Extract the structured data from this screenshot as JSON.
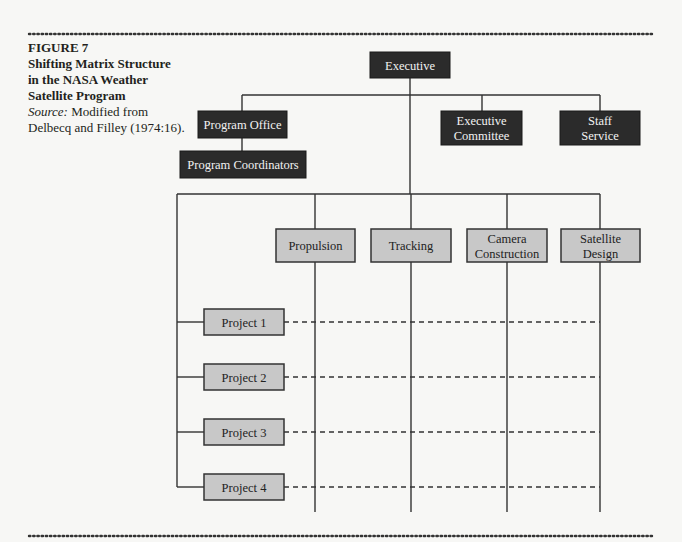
{
  "figure": {
    "label": "FIGURE 7",
    "title_lines": [
      "Shifting Matrix Structure",
      "in the NASA Weather",
      "Satellite Program"
    ],
    "source_label": "Source:",
    "source_text_lines": [
      " Modified from",
      "Delbecq and Filley (1974:16)."
    ]
  },
  "nodes": {
    "executive": [
      "Executive"
    ],
    "program_office": [
      "Program Office"
    ],
    "program_coordinators": [
      "Program Coordinators"
    ],
    "executive_committee": [
      "Executive",
      "Committee"
    ],
    "staff_service": [
      "Staff",
      "Service"
    ],
    "functions": [
      [
        "Propulsion"
      ],
      [
        "Tracking"
      ],
      [
        "Camera",
        "Construction"
      ],
      [
        "Satellite",
        "Design"
      ]
    ],
    "projects": [
      "Project 1",
      "Project 2",
      "Project 3",
      "Project 4"
    ]
  },
  "colors": {
    "management_box": "#2b2b2b",
    "unit_box": "#c8c8c8"
  }
}
